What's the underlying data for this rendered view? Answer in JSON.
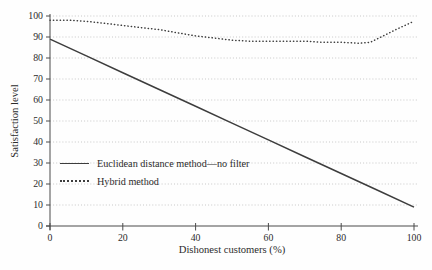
{
  "figure": {
    "background": "#fefefe"
  },
  "chart_data": {
    "type": "line",
    "title": "",
    "xlabel": "Dishonest customers (%)",
    "ylabel": "Satisfaction level",
    "xlim": [
      0,
      100
    ],
    "ylim": [
      0,
      100
    ],
    "xticks": [
      0,
      20,
      40,
      60,
      80,
      100
    ],
    "yticks": [
      0,
      10,
      20,
      30,
      40,
      50,
      60,
      70,
      80,
      90,
      100
    ],
    "grid": "horizontal-dotted",
    "legend_position": "inside-lower-left",
    "colors": {
      "axis": "#4a4a4a",
      "grid": "#c3c3c3",
      "text": "#2b2b2b",
      "line": "#3d3d3d"
    },
    "series": [
      {
        "name": "Euclidean distance method—no filter",
        "style": "solid",
        "color": "#3d3d3d",
        "x": [
          0,
          10,
          20,
          30,
          40,
          50,
          60,
          70,
          80,
          90,
          100
        ],
        "y": [
          89,
          81,
          73,
          65,
          57,
          49,
          41,
          33,
          25,
          17,
          9
        ]
      },
      {
        "name": "Hybrid method",
        "style": "dotted",
        "color": "#3d3d3d",
        "x": [
          0,
          5,
          10,
          15,
          20,
          25,
          30,
          35,
          40,
          45,
          50,
          55,
          60,
          65,
          70,
          75,
          80,
          85,
          88,
          91,
          95,
          100
        ],
        "y": [
          98,
          98,
          97.5,
          96.5,
          95.5,
          94.5,
          93.5,
          92,
          90.5,
          89.5,
          88.5,
          88,
          88,
          88,
          88,
          87.5,
          87.5,
          87,
          87.5,
          90,
          93.5,
          97.5
        ]
      }
    ]
  }
}
